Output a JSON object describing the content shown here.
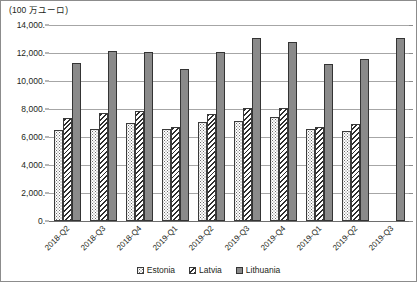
{
  "chart_data": {
    "type": "bar",
    "title": "",
    "axis_unit_label": "(100 万ユーロ)",
    "xlabel": "",
    "ylabel": "",
    "ylim": [
      0,
      14000
    ],
    "ytick_step": 2000,
    "ytick_labels": [
      "14,000.",
      "12,000.",
      "10,000.",
      "8,000.",
      "6,000.",
      "4,000.",
      "2,000.",
      "0."
    ],
    "ytick_values": [
      14000,
      12000,
      10000,
      8000,
      6000,
      4000,
      2000,
      0
    ],
    "grid": true,
    "legend_position": "bottom-center",
    "categories": [
      "2018-Q2",
      "2018-Q3",
      "2018-Q4",
      "2019-Q1",
      "2019-Q2",
      "2019-Q3",
      "2019-Q4",
      "2019-Q1",
      "2019-Q2",
      "2019-Q3"
    ],
    "series": [
      {
        "name": "Estonia",
        "pattern": "dotted",
        "color": "#ffffff",
        "values": [
          6500,
          6550,
          7000,
          6550,
          7050,
          7150,
          7450,
          6550,
          6450,
          null
        ]
      },
      {
        "name": "Latvia",
        "pattern": "diagonal-hatch",
        "color": "#ffffff",
        "values": [
          7350,
          7700,
          7850,
          6750,
          7650,
          8050,
          8050,
          6750,
          6900,
          null
        ]
      },
      {
        "name": "Lithuania",
        "pattern": "solid",
        "color": "#8a8a8a",
        "values": [
          11300,
          12150,
          12050,
          10850,
          12100,
          13050,
          12800,
          11250,
          11600,
          13100
        ]
      }
    ]
  }
}
